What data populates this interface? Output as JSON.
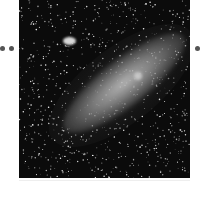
{
  "image": {
    "subject": "spiral galaxy (Andromeda-like) with star field",
    "background_color": "#0b0b0b",
    "galaxy_color": "#bcbcbc"
  },
  "navigation": {
    "left_dots": 2,
    "right_dots": 1,
    "dot_color": "#555555"
  }
}
